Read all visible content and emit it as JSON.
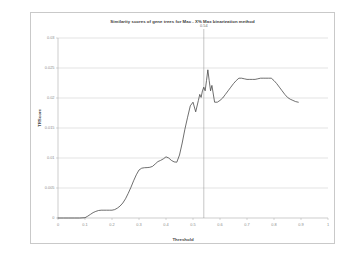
{
  "chart_data": {
    "type": "line",
    "title": "Similarity scores of gene trees for Mac - X% Max binarization method",
    "xlabel": "Threshold",
    "ylabel": "TRScore",
    "xlim": [
      0,
      1
    ],
    "ylim": [
      0,
      0.03
    ],
    "grid": true,
    "legend": "none",
    "xticks": [
      "0",
      "0.1",
      "0.2",
      "0.3",
      "0.4",
      "0.5",
      "0.6",
      "0.7",
      "0.8",
      "0.9",
      "1"
    ],
    "xtick_values": [
      0,
      0.1,
      0.2,
      0.3,
      0.4,
      0.5,
      0.6,
      0.7,
      0.8,
      0.9,
      1
    ],
    "yticks": [
      "0",
      "0.005",
      "0.01",
      "0.015",
      "0.02",
      "0.025",
      "0.03"
    ],
    "ytick_values": [
      0,
      0.005,
      0.01,
      0.015,
      0.02,
      0.025,
      0.03
    ],
    "annotations": [
      {
        "name": "threshold-marker",
        "label": "0.54",
        "x": 0.54,
        "type": "vertical-line"
      }
    ],
    "series": [
      {
        "name": "TRScore",
        "color": "#3f3f3f",
        "x": [
          0.0,
          0.02,
          0.04,
          0.06,
          0.08,
          0.1,
          0.11,
          0.12,
          0.13,
          0.14,
          0.15,
          0.16,
          0.17,
          0.18,
          0.19,
          0.2,
          0.21,
          0.22,
          0.23,
          0.24,
          0.25,
          0.26,
          0.27,
          0.28,
          0.29,
          0.3,
          0.31,
          0.32,
          0.33,
          0.34,
          0.35,
          0.36,
          0.37,
          0.38,
          0.39,
          0.4,
          0.41,
          0.42,
          0.43,
          0.44,
          0.45,
          0.46,
          0.47,
          0.48,
          0.49,
          0.5,
          0.51,
          0.52,
          0.525,
          0.53,
          0.535,
          0.54,
          0.545,
          0.55,
          0.555,
          0.56,
          0.565,
          0.57,
          0.58,
          0.59,
          0.6,
          0.61,
          0.62,
          0.63,
          0.64,
          0.65,
          0.66,
          0.67,
          0.68,
          0.69,
          0.7,
          0.71,
          0.72,
          0.73,
          0.74,
          0.75,
          0.76,
          0.77,
          0.78,
          0.79,
          0.8,
          0.81,
          0.82,
          0.83,
          0.84,
          0.85,
          0.86,
          0.87,
          0.88,
          0.89
        ],
        "y": [
          0.0,
          0.0,
          0.0,
          0.0,
          0.0,
          5e-05,
          0.0003,
          0.0006,
          0.0009,
          0.0011,
          0.00125,
          0.0013,
          0.0013,
          0.0013,
          0.0013,
          0.0013,
          0.0014,
          0.00165,
          0.002,
          0.0025,
          0.0032,
          0.0041,
          0.0051,
          0.0062,
          0.0072,
          0.008,
          0.0083,
          0.00838,
          0.0084,
          0.00845,
          0.0086,
          0.009,
          0.0094,
          0.0096,
          0.00985,
          0.0102,
          0.01,
          0.0096,
          0.00935,
          0.0093,
          0.0105,
          0.0125,
          0.0148,
          0.0168,
          0.0187,
          0.0193,
          0.0177,
          0.0196,
          0.0206,
          0.0201,
          0.0212,
          0.0218,
          0.0212,
          0.0229,
          0.0247,
          0.0229,
          0.0212,
          0.0221,
          0.0193,
          0.0193,
          0.0196,
          0.02,
          0.0206,
          0.0212,
          0.0218,
          0.0224,
          0.0229,
          0.0233,
          0.0233,
          0.0232,
          0.0231,
          0.0231,
          0.0231,
          0.0231,
          0.0232,
          0.0233,
          0.0233,
          0.0233,
          0.0233,
          0.0233,
          0.0229,
          0.0224,
          0.0218,
          0.0212,
          0.0206,
          0.0201,
          0.0198,
          0.0196,
          0.0194,
          0.0193
        ]
      }
    ]
  }
}
